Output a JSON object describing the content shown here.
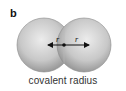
{
  "panel_label": "b",
  "diagram": {
    "left_sphere_label": "r",
    "right_sphere_label": "r",
    "caption": "covalent radius",
    "colors": {
      "sphere_light": "#e6e6e6",
      "sphere_dark": "#9a9a9a",
      "arrow": "#111111"
    }
  }
}
